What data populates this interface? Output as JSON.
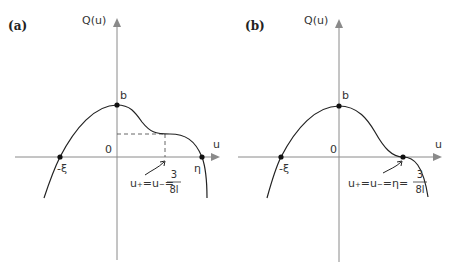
{
  "panels": [
    {
      "tag": "(a)",
      "y_axis_label": "Q(u)",
      "x_axis_label": "u",
      "origin_label": "0",
      "max_point_label": "b",
      "left_root_label": "-ξ",
      "right_root_label": "η",
      "annotation": {
        "prefix": "u₊=u₋=",
        "frac_num": "3",
        "frac_den": "8l"
      }
    },
    {
      "tag": "(b)",
      "y_axis_label": "Q(u)",
      "x_axis_label": "u",
      "origin_label": "0",
      "max_point_label": "b",
      "left_root_label": "-ξ",
      "annotation": {
        "prefix": "u₊=u₋=η=",
        "frac_num": "3",
        "frac_den": "8l"
      }
    }
  ]
}
